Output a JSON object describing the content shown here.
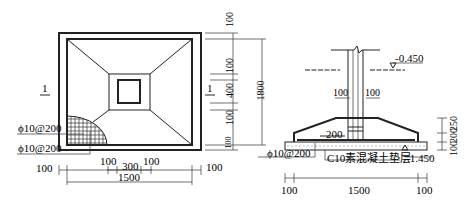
{
  "plan_view": {
    "section_mark_left": "1",
    "section_mark_right": "1",
    "rebar_labels": [
      "ϕ10@200",
      "ϕ10@200"
    ],
    "bottom_dims": {
      "left_offset": "100",
      "right_offset": "100",
      "inner_left": "100",
      "column": "300",
      "inner_right": "100",
      "total": "1500"
    },
    "right_dims": {
      "top": "100",
      "upper": "100",
      "column": "400",
      "lower": "100",
      "bottom": "100",
      "total": "1800"
    }
  },
  "section_view": {
    "ground_level": "-0.450",
    "bottom_level": "-1.450",
    "cover_left": "100",
    "cover_right": "100",
    "step_dim": "200",
    "rebar_label": "ϕ10@200",
    "cushion_label": "C10素混凝土垫层",
    "bottom_dims": {
      "left": "100",
      "middle": "1500",
      "right": "100"
    },
    "right_dims": {
      "bottom": "100",
      "middle": "200",
      "top": "250"
    }
  }
}
